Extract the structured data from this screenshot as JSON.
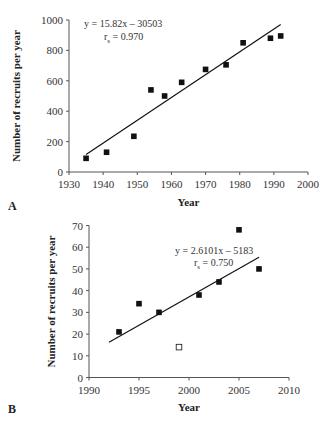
{
  "chart_data": [
    {
      "panel": "A",
      "type": "scatter",
      "title": "",
      "xlabel": "Year",
      "ylabel": "Number of recruits per year",
      "xlim": [
        1930,
        2000
      ],
      "ylim": [
        0,
        1000
      ],
      "xticks": [
        1930,
        1940,
        1950,
        1960,
        1970,
        1980,
        1990,
        2000
      ],
      "yticks": [
        0,
        200,
        400,
        600,
        800,
        1000
      ],
      "grid": false,
      "series": [
        {
          "name": "Recruits",
          "marker": "filled-square",
          "x": [
            1935,
            1941,
            1949,
            1954,
            1958,
            1963,
            1970,
            1976,
            1981,
            1989,
            1992
          ],
          "y": [
            90,
            130,
            235,
            540,
            500,
            590,
            675,
            705,
            850,
            880,
            895
          ]
        }
      ],
      "trendline": {
        "x": [
          1935,
          1992
        ],
        "y": [
          115,
          970
        ]
      },
      "annotations": {
        "equation": "y = 15.82x – 30503",
        "r_label": "r",
        "r_sub": "s",
        "r_value": " = 0.970"
      }
    },
    {
      "panel": "B",
      "type": "scatter",
      "title": "",
      "xlabel": "Year",
      "ylabel": "Number of recruits per year",
      "xlim": [
        1990,
        2010
      ],
      "ylim": [
        0,
        70
      ],
      "xticks": [
        1990,
        1995,
        2000,
        2005,
        2010
      ],
      "yticks": [
        0,
        10,
        20,
        30,
        40,
        50,
        60,
        70
      ],
      "grid": false,
      "series": [
        {
          "name": "Recruits",
          "marker": "filled-square",
          "x": [
            1993,
            1995,
            1997,
            2001,
            2003,
            2005,
            2007
          ],
          "y": [
            21,
            34,
            30,
            38,
            44,
            68,
            50
          ]
        },
        {
          "name": "Outlier (excluded)",
          "marker": "open-square",
          "x": [
            1999
          ],
          "y": [
            14
          ]
        }
      ],
      "trendline": {
        "x": [
          1992,
          2007
        ],
        "y": [
          16.2,
          55.4
        ]
      },
      "annotations": {
        "equation": "y = 2.6101x – 5183",
        "r_label": "r",
        "r_sub": "s",
        "r_value": " = 0.750"
      }
    }
  ],
  "panels": [
    {
      "label": "A"
    },
    {
      "label": "B"
    }
  ]
}
